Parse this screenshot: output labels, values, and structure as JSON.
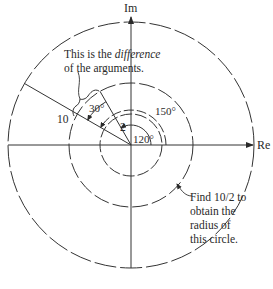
{
  "diagram": {
    "type": "argand-diagram",
    "axes": {
      "imaginary_label": "Im",
      "real_label": "Re"
    },
    "circles": [
      {
        "name": "outer",
        "modulus": "10",
        "style": "dashed"
      },
      {
        "name": "middle",
        "modulus": "5",
        "style": "dashed"
      },
      {
        "name": "inner",
        "modulus": "2",
        "style": "dashed"
      }
    ],
    "vectors": [
      {
        "modulus_label": "10",
        "argument": "150°"
      },
      {
        "modulus_label": "2",
        "argument": "120°"
      }
    ],
    "angle_labels": {
      "difference": "30°",
      "arg_large": "150°",
      "arg_small": "120°"
    },
    "annotations": {
      "difference_note": {
        "line1_prefix": "This is the ",
        "line1_emph": "difference",
        "line2": "of the arguments."
      },
      "radius_note": {
        "line1": "Find 10/2 to",
        "line2": "obtain the",
        "line3": "radius of",
        "line4": "this circle."
      }
    },
    "colors": {
      "ink": "#2a2a2a",
      "background": "#ffffff"
    }
  }
}
